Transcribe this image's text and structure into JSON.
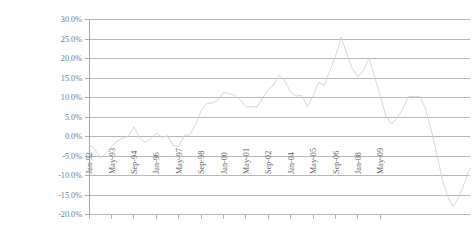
{
  "chart_data": {
    "type": "line",
    "title": "",
    "xlabel": "",
    "ylabel": "Annual % Change",
    "ylim": [
      -20,
      30
    ],
    "ytick_labels": [
      "30.0%",
      "25.0%",
      "20.0%",
      "15.0%",
      "10.0%",
      "5.0%",
      "0.0%",
      "-5.0%",
      "-10.0%",
      "-15.0%",
      "-20.0%"
    ],
    "ytick_values": [
      30,
      25,
      20,
      15,
      10,
      5,
      0,
      -5,
      -10,
      -15,
      -20
    ],
    "xtick_labels": [
      "Jan-92",
      "May-93",
      "Sep-94",
      "Jan-96",
      "May-97",
      "Sep-98",
      "Jan-00",
      "May-01",
      "Sep-02",
      "Jan-04",
      "May-05",
      "Sep-06",
      "Jan-08",
      "May-09"
    ],
    "xtick_index": [
      0,
      4,
      8,
      12,
      16,
      20,
      24,
      28,
      32,
      36,
      40,
      44,
      48,
      52
    ],
    "grid": true,
    "legend": "none",
    "series": [
      {
        "name": "Annual % Change",
        "values": [
          -2.0,
          -3.2,
          -5.5,
          -4.4,
          -2.6,
          -1.2,
          -0.4,
          0.0,
          2.5,
          -0.3,
          -1.5,
          -0.6,
          0.9,
          -0.2,
          0.2,
          -2.2,
          -2.6,
          0.3,
          0.4,
          3.0,
          6.6,
          8.5,
          8.6,
          9.3,
          11.3,
          11.0,
          10.6,
          9.4,
          7.6,
          7.6,
          7.6,
          9.9,
          12.1,
          13.3,
          15.8,
          14.2,
          11.3,
          10.4,
          10.5,
          7.6,
          10.5,
          13.9,
          13.1,
          16.9,
          20.6,
          25.5,
          21.3,
          17.4,
          15.3,
          17.0,
          20.2,
          15.3,
          10.3,
          5.2,
          3.2,
          4.8,
          7.0,
          10.2,
          10.3,
          10.3,
          7.4,
          2.2,
          -4.0,
          -10.6,
          -15.4,
          -18.0,
          -15.6,
          -12.0,
          -8.1
        ]
      }
    ]
  },
  "axis": {
    "y_title": "Annual % Change"
  }
}
